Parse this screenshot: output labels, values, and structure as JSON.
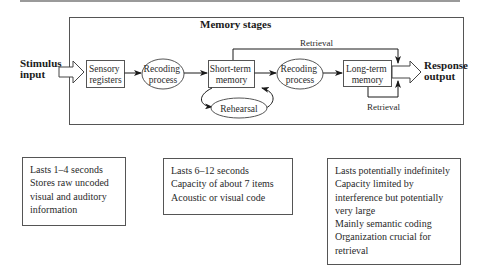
{
  "diagram": {
    "title": "Memory stages",
    "input_label": [
      "Stimulus",
      "input"
    ],
    "output_label": [
      "Response",
      "output"
    ],
    "nodes": {
      "sensory": [
        "Sensory",
        "registers"
      ],
      "recoding1": [
        "Recoding",
        "process"
      ],
      "stm": [
        "Short-term",
        "memory"
      ],
      "rehearsal": "Rehearsal",
      "recoding2": [
        "Recoding",
        "process"
      ],
      "ltm": [
        "Long-term",
        "memory"
      ]
    },
    "retrieval_top": "Retrieval",
    "retrieval_bottom": "Retrieval"
  },
  "info_boxes": [
    {
      "lines": [
        "Lasts 1–4 seconds",
        "Stores raw uncoded",
        "visual and auditory",
        "information"
      ]
    },
    {
      "lines": [
        "Lasts 6–12 seconds",
        "Capacity of about 7 items",
        "Acoustic or visual code"
      ]
    },
    {
      "lines": [
        "Lasts potentially indefinitely",
        "Capacity limited by",
        "interference but potentially",
        "very large",
        "Mainly semantic coding",
        "Organization crucial for",
        "retrieval"
      ]
    }
  ]
}
